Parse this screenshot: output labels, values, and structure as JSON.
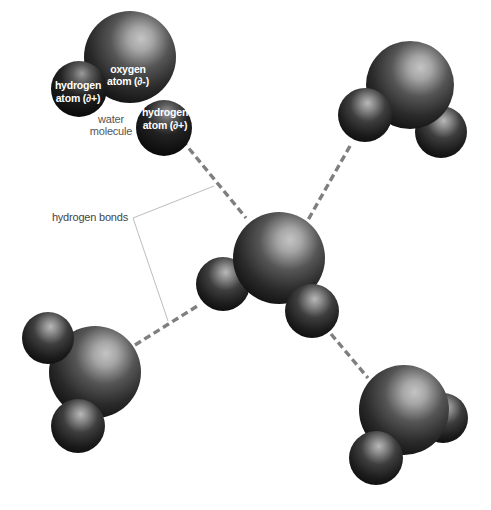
{
  "diagram": {
    "labels": {
      "oxygen_line1": "oxygen",
      "oxygen_line2": "atom (∂-)",
      "hydrogen_left_line1": "hydrogen",
      "hydrogen_left_line2": "atom (∂+)",
      "hydrogen_right_line1": "hydrogen",
      "hydrogen_right_line2": "atom (∂+)",
      "water_line1": "water",
      "water_line2": "molecule",
      "hydrogen_bonds": "hydrogen bonds"
    },
    "colors": {
      "atom_dark": "#141414",
      "atom_mid": "#4a4a4a",
      "atom_highlight": "#bdbdbd",
      "bond": "#7f7f7f",
      "leader": "#b5b5b5",
      "background": "#ffffff"
    },
    "molecules": [
      {
        "name": "top-left",
        "oxygen": [
          130,
          57,
          46
        ],
        "hydrogens": [
          [
            79,
            89,
            28
          ],
          [
            164,
            128,
            28
          ]
        ]
      },
      {
        "name": "top-right",
        "oxygen": [
          410,
          85,
          44
        ],
        "hydrogens": [
          [
            365,
            115,
            27
          ],
          [
            441,
            132,
            26
          ]
        ]
      },
      {
        "name": "center",
        "oxygen": [
          279,
          258,
          46
        ],
        "hydrogens": [
          [
            223,
            284,
            27
          ],
          [
            312,
            311,
            27
          ]
        ]
      },
      {
        "name": "bottom-left",
        "oxygen": [
          95,
          372,
          46
        ],
        "hydrogens": [
          [
            48,
            338,
            26
          ],
          [
            78,
            426,
            27
          ]
        ]
      },
      {
        "name": "bottom-right",
        "oxygen": [
          404,
          410,
          45
        ],
        "hydrogens": [
          [
            443,
            418,
            25
          ],
          [
            376,
            458,
            27
          ]
        ]
      }
    ],
    "hydrogen_bonds": [
      {
        "from": [
          182,
          140
        ],
        "to": [
          246,
          218
        ]
      },
      {
        "from": [
          350,
          146
        ],
        "to": [
          308,
          220
        ]
      },
      {
        "from": [
          135,
          345
        ],
        "to": [
          199,
          305
        ]
      },
      {
        "from": [
          331,
          334
        ],
        "to": [
          368,
          378
        ]
      }
    ]
  }
}
